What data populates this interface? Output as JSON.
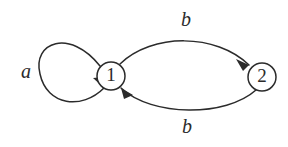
{
  "figure": {
    "background_color": "#ffffff",
    "stroke_color": "#2b2b2b",
    "width": 288,
    "height": 147
  },
  "nodes": [
    {
      "id": "1",
      "label": "1",
      "cx": 111,
      "cy": 76,
      "r": 14
    },
    {
      "id": "2",
      "label": "2",
      "cx": 262,
      "cy": 77,
      "r": 14
    }
  ],
  "edges": [
    {
      "id": "self-loop-1",
      "label": "a",
      "from": "1",
      "to": "1",
      "label_x": 26,
      "label_y": 73,
      "path": "M 100 66 C 70 28 32 42 40 74 C 47 106 82 110 104 88"
    },
    {
      "id": "edge-1-to-2-top",
      "label": "b",
      "from": "1",
      "to": "2",
      "label_x": 186,
      "label_y": 21,
      "path": "M 120 64 C 152 33 216 33 249 65"
    },
    {
      "id": "edge-2-to-1-bottom",
      "label": "b",
      "from": "2",
      "to": "1",
      "label_x": 187,
      "label_y": 128,
      "path": "M 256 90 C 226 117 152 117 121 88"
    }
  ],
  "arrowheads": [
    {
      "id": "arrowhead-into-1-from-loop",
      "points": "104,88 93,78 104,77"
    },
    {
      "id": "arrowhead-into-2",
      "points": "249,65 236,59 243,71"
    },
    {
      "id": "arrowhead-into-1-from-below",
      "points": "121,88 133,95 124,99"
    }
  ]
}
